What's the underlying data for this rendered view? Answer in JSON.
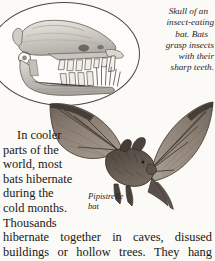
{
  "page": {
    "background_color": "#fbfaf7",
    "text_color": "#191714",
    "ink_color": "#4b4742"
  },
  "skull_figure": {
    "shape": "oval",
    "subject": "bat-skull-profile",
    "caption_lines": [
      "Skull of an",
      "insect-eating",
      "bat. Bats",
      "grasp insects",
      "with their",
      "sharp teeth."
    ],
    "caption_full": "Skull of an insect-eating bat. Bats grasp insects with their sharp teeth."
  },
  "bat_figure": {
    "subject": "pipistrelle-bat-in-flight",
    "label_lines": [
      "Pipistrelle",
      "bat"
    ],
    "label_full": "Pipistrelle bat"
  },
  "body_text": {
    "narrow_lines": [
      "In cooler",
      "parts of the",
      "world, most",
      "bats hibernate",
      "during the",
      "cold months.",
      "Thousands"
    ],
    "wide_lines": [
      [
        "hibernate",
        "together",
        "in",
        "caves,",
        "disused"
      ],
      [
        "buildings",
        "or",
        "hollow",
        "trees.",
        "They",
        "hang"
      ]
    ],
    "full_text": "In cooler parts of the world, most bats hibernate during the cold months. Thousands hibernate together in caves, disused buildings or hollow trees. They hang"
  }
}
